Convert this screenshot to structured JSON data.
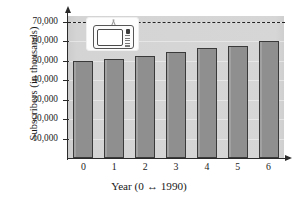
{
  "chart_data": {
    "type": "bar",
    "title": "",
    "xlabel": "Year (0 ↔ 1990)",
    "ylabel": "Subscribers (in thousands)",
    "categories": [
      "0",
      "1",
      "2",
      "3",
      "4",
      "5",
      "6"
    ],
    "values": [
      50000,
      51000,
      52500,
      54500,
      56500,
      57500,
      60000
    ],
    "ylim": [
      0,
      73000
    ],
    "ytick_labels": [
      "10,000",
      "20,000",
      "30,000",
      "40,000",
      "50,000",
      "60,000",
      "70,000"
    ],
    "ytick_values": [
      10000,
      20000,
      30000,
      40000,
      50000,
      60000,
      70000
    ],
    "grid": true,
    "legend": "none",
    "annotations": [
      {
        "name": "reference-line",
        "style": "dashed",
        "value": 70000
      },
      {
        "name": "television-icon",
        "description": "television set inset graphic"
      }
    ],
    "colors": {
      "bar_fill": "#8f8f8f",
      "bar_edge": "#3a3a3a",
      "plot_background": "#d2d2d2",
      "axis": "#2b2b2b",
      "reference_line": "#232323",
      "text": "#1a1a1a"
    }
  },
  "icons": {
    "television": "tv-icon",
    "x_axis_arrow": "arrow-right-icon",
    "y_axis_arrow": "arrow-up-icon"
  }
}
